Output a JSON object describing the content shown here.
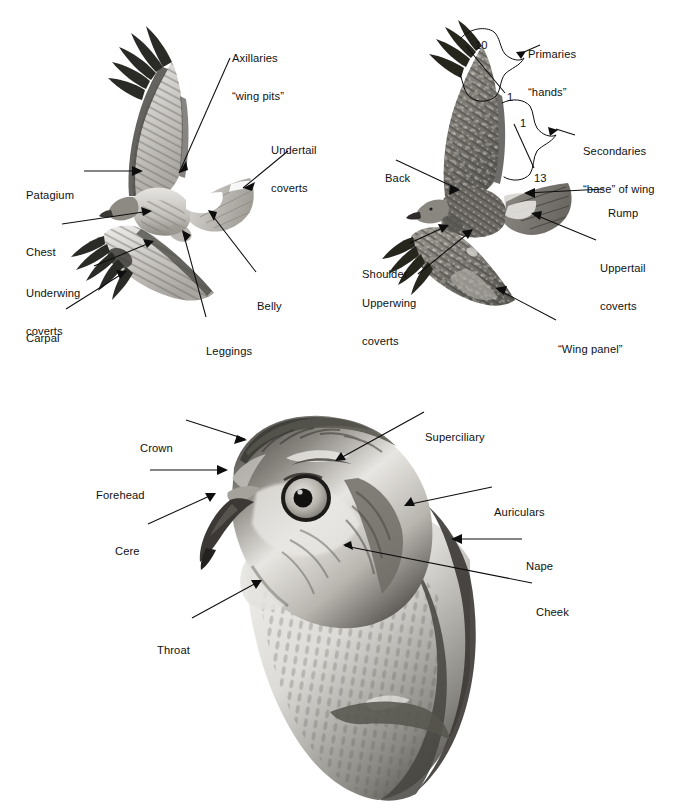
{
  "plate": {
    "title": "Hawk topography plate",
    "subject": "Red-tailed Hawk (Buteo jamaicensis) anatomical topography",
    "background_color": "#ffffff",
    "ink_color": "#0d0d0d",
    "figures": [
      {
        "id": "underside",
        "caption_implied": "Underside of soaring hawk (ventral view)"
      },
      {
        "id": "upperside",
        "caption_implied": "Upperside of soaring hawk (dorsal view)"
      },
      {
        "id": "head",
        "caption_implied": "Head portrait, left profile"
      }
    ]
  },
  "figure_underside": {
    "labels": [
      {
        "id": "axillaries",
        "line1": "Axillaries",
        "line2": "“wing pits”",
        "x": 232,
        "y": 27,
        "align": "left",
        "target_x": 171,
        "target_y": 180
      },
      {
        "id": "undertail-coverts",
        "line1": "Undertail",
        "line2": "coverts",
        "x": 271,
        "y": 119,
        "align": "left",
        "target_x": 240,
        "target_y": 190
      },
      {
        "id": "patagium",
        "line1": "Patagium",
        "line2": "",
        "x": 26,
        "y": 164,
        "align": "left",
        "target_x": 140,
        "target_y": 171
      },
      {
        "id": "chest",
        "line1": "Chest",
        "line2": "",
        "x": 26,
        "y": 221,
        "align": "left",
        "target_x": 153,
        "target_y": 212
      },
      {
        "id": "underwing-coverts",
        "line1": "Underwing",
        "line2": "coverts",
        "x": 26,
        "y": 262,
        "align": "left",
        "target_x": 153,
        "target_y": 243
      },
      {
        "id": "belly",
        "line1": "Belly",
        "line2": "",
        "x": 257,
        "y": 275,
        "align": "left",
        "target_x": 207,
        "target_y": 212
      },
      {
        "id": "carpal",
        "line1": "Carpal",
        "line2": "",
        "x": 26,
        "y": 307,
        "align": "left",
        "target_x": 126,
        "target_y": 272
      },
      {
        "id": "leggings",
        "line1": "Leggings",
        "line2": "",
        "x": 206,
        "y": 320,
        "align": "left",
        "target_x": 181,
        "target_y": 230
      }
    ]
  },
  "figure_upperside": {
    "labels": [
      {
        "id": "primaries",
        "line1": "Primaries",
        "line2": "“hands”",
        "x": 528,
        "y": 23,
        "align": "left"
      },
      {
        "id": "secondaries",
        "line1": "Secondaries",
        "line2": "“base” of wing",
        "x": 583,
        "y": 120,
        "align": "left"
      },
      {
        "id": "back",
        "line1": "Back",
        "line2": "",
        "x": 385,
        "y": 147,
        "align": "left",
        "target_x": 459,
        "target_y": 190
      },
      {
        "id": "rump",
        "line1": "Rump",
        "line2": "",
        "x": 608,
        "y": 182,
        "align": "left",
        "target_x": 524,
        "target_y": 194
      },
      {
        "id": "shoulder",
        "line1": "Shoulder",
        "line2": "",
        "x": 362,
        "y": 243,
        "align": "left",
        "target_x": 448,
        "target_y": 226
      },
      {
        "id": "uppertail-coverts",
        "line1": "Uppertail",
        "line2": "coverts",
        "x": 600,
        "y": 237,
        "align": "left",
        "target_x": 531,
        "target_y": 215
      },
      {
        "id": "upperwing-coverts",
        "line1": "Upperwing",
        "line2": "coverts",
        "x": 362,
        "y": 272,
        "align": "left",
        "target_x": 472,
        "target_y": 231
      },
      {
        "id": "wing-panel",
        "line1": "“Wing panel”",
        "line2": "",
        "x": 558,
        "y": 318,
        "align": "left",
        "target_x": 495,
        "target_y": 288
      }
    ],
    "feather_counts": [
      {
        "id": "primary-outer",
        "value": "10",
        "x": 475,
        "y": 39
      },
      {
        "id": "primary-inner",
        "value": "1",
        "x": 507,
        "y": 91
      },
      {
        "id": "secondary-outer",
        "value": "1",
        "x": 520,
        "y": 117
      },
      {
        "id": "secondary-inner",
        "value": "13",
        "x": 534,
        "y": 172
      }
    ]
  },
  "figure_head": {
    "labels": [
      {
        "id": "crown",
        "line1": "Crown",
        "line2": "",
        "x": 140,
        "y": 417,
        "align": "left",
        "target_x": 247,
        "target_y": 440
      },
      {
        "id": "superciliary",
        "line1": "Superciliary",
        "line2": "",
        "x": 425,
        "y": 406,
        "align": "left",
        "target_x": 335,
        "target_y": 461
      },
      {
        "id": "forehead",
        "line1": "Forehead",
        "line2": "",
        "x": 96,
        "y": 464,
        "align": "left",
        "target_x": 228,
        "target_y": 470
      },
      {
        "id": "auriculars",
        "line1": "Auriculars",
        "line2": "",
        "x": 494,
        "y": 481,
        "align": "left",
        "target_x": 404,
        "target_y": 505
      },
      {
        "id": "cere",
        "line1": "Cere",
        "line2": "",
        "x": 115,
        "y": 520,
        "align": "left",
        "target_x": 216,
        "target_y": 495
      },
      {
        "id": "nape",
        "line1": "Nape",
        "line2": "",
        "x": 526,
        "y": 535,
        "align": "left",
        "target_x": 451,
        "target_y": 539
      },
      {
        "id": "cheek",
        "line1": "Cheek",
        "line2": "",
        "x": 536,
        "y": 581,
        "align": "left",
        "target_x": 343,
        "target_y": 546
      },
      {
        "id": "throat",
        "line1": "Throat",
        "line2": "",
        "x": 157,
        "y": 619,
        "align": "left",
        "target_x": 262,
        "target_y": 582
      }
    ]
  }
}
